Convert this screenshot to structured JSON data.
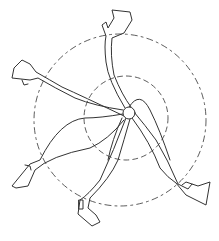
{
  "figure": {
    "stroke_color": "#333333",
    "background": "#ffffff",
    "hub": {
      "cx": 129,
      "cy": 113,
      "r": 6
    },
    "circles": [
      {
        "name": "outer-motion-circle",
        "cx": 120,
        "cy": 120,
        "r": 86
      },
      {
        "name": "inner-motion-circle",
        "cx": 126,
        "cy": 118,
        "r": 42
      }
    ],
    "limbs": [
      "top-arm",
      "left-arm",
      "lower-left-leg",
      "lower-right-leg"
    ]
  }
}
